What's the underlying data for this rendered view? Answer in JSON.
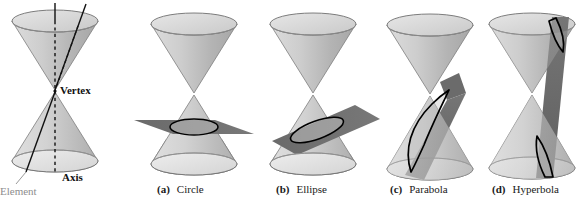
{
  "figure": {
    "background_color": "#ffffff",
    "cone_fill_light": "#d8d8d8",
    "cone_fill_mid": "#c2c2c2",
    "cone_fill_dark": "#a9a9a9",
    "cone_stroke": "#7a7a7a",
    "plane_fill": "#6e6e6e",
    "plane_fill_light": "#8a8a8a",
    "curve_stroke": "#000000",
    "axis_color": "#111111",
    "element_color": "#111111",
    "label_color": "#111111",
    "muted_label_color": "#8d8d8d"
  },
  "panels": [
    {
      "id": "definition",
      "label": "",
      "name": "Double cone with axis, element and vertex",
      "annotations": [
        {
          "key": "vertex",
          "text": "Vertex",
          "style": "bold"
        },
        {
          "key": "axis",
          "text": "Axis",
          "style": "bold"
        },
        {
          "key": "element",
          "text": "Element",
          "style": "muted"
        }
      ]
    },
    {
      "id": "circle",
      "label": "(a)",
      "name": "Circle",
      "plane_orientation": "horizontal, perpendicular to axis",
      "nappes_cut": 1
    },
    {
      "id": "ellipse",
      "label": "(b)",
      "name": "Ellipse",
      "plane_orientation": "oblique, tilted but not parallel to an element",
      "nappes_cut": 1
    },
    {
      "id": "parabola",
      "label": "(c)",
      "name": "Parabola",
      "plane_orientation": "parallel to an element of the cone",
      "nappes_cut": 1
    },
    {
      "id": "hyperbola",
      "label": "(d)",
      "name": "Hyperbola",
      "plane_orientation": "vertical, parallel to the axis",
      "nappes_cut": 2
    }
  ],
  "captions": [
    {
      "label": "(a)",
      "text": "Circle"
    },
    {
      "label": "(b)",
      "text": "Ellipse"
    },
    {
      "label": "(c)",
      "text": "Parabola"
    },
    {
      "label": "(d)",
      "text": "Hyperbola"
    }
  ]
}
